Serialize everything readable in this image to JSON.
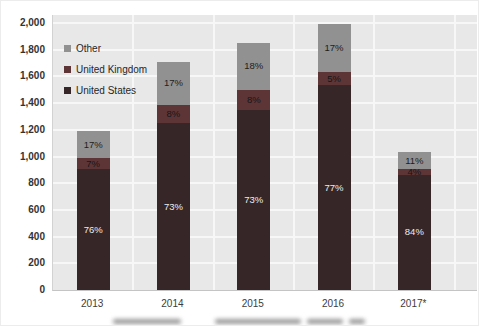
{
  "chart_data": {
    "type": "bar",
    "stacked": true,
    "title": "",
    "xlabel": "",
    "ylabel": "",
    "categories": [
      "2013",
      "2014",
      "2015",
      "2016",
      "2017*"
    ],
    "totals": [
      1190,
      1710,
      1850,
      1990,
      1030
    ],
    "series": [
      {
        "name": "United States",
        "color": "#372627",
        "label_color": "#ededed",
        "values": [
          904,
          1248,
          1351,
          1532,
          865
        ],
        "labels": [
          "76%",
          "73%",
          "73%",
          "77%",
          "84%"
        ]
      },
      {
        "name": "United Kingdom",
        "color": "#5e3536",
        "label_color": "#161616",
        "values": [
          83,
          137,
          148,
          100,
          41
        ],
        "labels": [
          "7%",
          "8%",
          "8%",
          "5%",
          "4%"
        ]
      },
      {
        "name": "Other",
        "color": "#919191",
        "label_color": "#1d1d1d",
        "values": [
          203,
          325,
          351,
          358,
          124
        ],
        "labels": [
          "17%",
          "17%",
          "18%",
          "17%",
          "11%"
        ]
      }
    ],
    "ylim": [
      0,
      2000
    ],
    "ytick_step": 200,
    "ytick_labels": [
      "0",
      "200",
      "400",
      "600",
      "800",
      "1,000",
      "1,200",
      "1,400",
      "1,600",
      "1,800",
      "2,000"
    ],
    "grid": true,
    "plot_bg": "#e8e8e8",
    "grid_color": "#f7f7f7",
    "legend": {
      "position": "top-left",
      "items": [
        "Other",
        "United Kingdom",
        "United States"
      ]
    }
  }
}
